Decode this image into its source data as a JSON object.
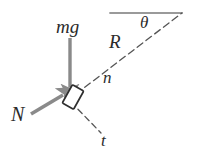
{
  "figure": {
    "type": "physics-force-diagram",
    "width": 197,
    "height": 163,
    "background_color": "#ffffff"
  },
  "colors": {
    "arrow_gray": "#8a8a8a",
    "line_dark": "#3a3a3a",
    "line_gray": "#9a9a9a",
    "text_dark": "#2b2b2b",
    "block_fill": "#ffffff",
    "block_stroke": "#2f2f2f"
  },
  "labels": {
    "mg": "mg",
    "R": "R",
    "theta": "θ",
    "n": "n",
    "t": "t",
    "N": "N"
  },
  "elements": {
    "block": {
      "name": "block",
      "center_x": 73,
      "center_y": 97,
      "width": 14,
      "height": 22,
      "rotation_deg": 29
    },
    "weight_arrow": {
      "name": "mg",
      "from_x": 70,
      "from_y": 38,
      "to_x": 70,
      "to_y": 91,
      "direction": "down"
    },
    "normal_arrow": {
      "name": "N",
      "from_x": 31,
      "from_y": 114,
      "to_x": 67,
      "to_y": 93,
      "direction": "up-right"
    },
    "radial_line": {
      "name": "R",
      "from_x": 76,
      "from_y": 94,
      "to_x": 182,
      "to_y": 13,
      "style": "dashed"
    },
    "horizontal_line": {
      "name": "horizontal-reference",
      "from_x": 110,
      "from_y": 13,
      "to_x": 182,
      "to_y": 13,
      "style": "solid-gray"
    },
    "tangential_line": {
      "name": "t",
      "from_x": 71,
      "from_y": 101,
      "to_x": 101,
      "to_y": 133,
      "style": "dashed"
    },
    "apex": {
      "x": 182,
      "y": 13
    }
  }
}
